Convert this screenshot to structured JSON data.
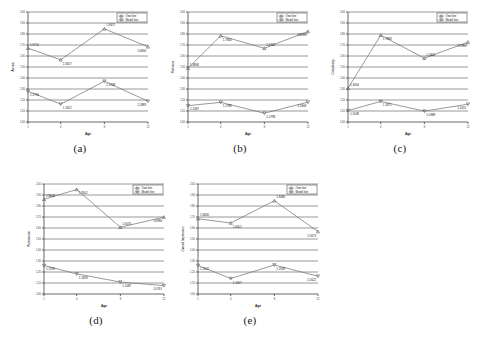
{
  "figure": {
    "panels": [
      {
        "caption": "(a)",
        "xlabel": "Age",
        "ylabel": "Aroma",
        "xticks": [
          "1",
          "4",
          "8",
          "12"
        ],
        "yticks": [
          "1.00",
          "1.10",
          "1.20",
          "1.30",
          "1.40",
          "1.50",
          "1.60",
          "1.70",
          "1.80",
          "1.90",
          "2.00"
        ],
        "legend": [
          "Own line",
          "Model line"
        ],
        "chart_data": {
          "type": "line",
          "title": "",
          "xlabel": "Age",
          "ylabel": "Aroma",
          "x": [
            1,
            4,
            8,
            12
          ],
          "xlim": [
            1,
            12
          ],
          "ylim": [
            1.0,
            2.0
          ],
          "grid": true,
          "legend_position": "top-right",
          "series": [
            {
              "name": "Own line",
              "values": [
                1.671,
                1.5657,
                1.8471,
                1.6836
              ],
              "labels": [
                "1.6710",
                "1.5657",
                "1.8471",
                "1.6836"
              ]
            },
            {
              "name": "Model line",
              "values": [
                1.2794,
                1.1622,
                1.3708,
                1.1889
              ],
              "labels": [
                "1.2794",
                "1.1622",
                "1.3708",
                "1.1889"
              ]
            }
          ]
        }
      },
      {
        "caption": "(b)",
        "xlabel": "Age",
        "ylabel": "Richness",
        "xticks": [
          "1",
          "4",
          "8",
          "12"
        ],
        "yticks": [
          "1.00",
          "1.10",
          "1.20",
          "1.30",
          "1.40",
          "1.50",
          "1.60",
          "1.70",
          "1.80",
          "1.90",
          "2.00"
        ],
        "legend": [
          "Own line",
          "Model line"
        ],
        "chart_data": {
          "type": "line",
          "title": "",
          "xlabel": "Age",
          "ylabel": "Richness",
          "x": [
            1,
            4,
            8,
            12
          ],
          "xlim": [
            1,
            12
          ],
          "ylim": [
            1.0,
            2.0
          ],
          "grid": true,
          "legend_position": "top-right",
          "series": [
            {
              "name": "Own line",
              "values": [
                1.4884,
                1.784,
                1.6702,
                1.8236
              ],
              "labels": [
                "1.4884",
                "1.7840",
                "1.6702",
                "1.8236"
              ]
            },
            {
              "name": "Model line",
              "values": [
                1.1487,
                1.1788,
                1.0798,
                1.1808
              ],
              "labels": [
                "1.1487",
                "1.1788",
                "1.0798",
                "1.1808"
              ]
            }
          ]
        }
      },
      {
        "caption": "(c)",
        "xlabel": "Age",
        "ylabel": "Complexity",
        "xticks": [
          "1",
          "4",
          "8",
          "12"
        ],
        "yticks": [
          "1.00",
          "1.10",
          "1.20",
          "1.30",
          "1.40",
          "1.50",
          "1.60",
          "1.70",
          "1.80",
          "1.90",
          "2.00"
        ],
        "legend": [
          "Own line",
          "Model line"
        ],
        "chart_data": {
          "type": "line",
          "title": "",
          "xlabel": "Age",
          "ylabel": "Complexity",
          "x": [
            1,
            4,
            8,
            12
          ],
          "xlim": [
            1,
            12
          ],
          "ylim": [
            1.0,
            2.0
          ],
          "grid": true,
          "legend_position": "top-right",
          "series": [
            {
              "name": "Own line",
              "values": [
                1.3064,
                1.7888,
                1.5801,
                1.726
              ],
              "labels": [
                "1.3064",
                "1.7888",
                "1.5801",
                "1.7260"
              ]
            },
            {
              "name": "Model line",
              "values": [
                1.1038,
                1.1871,
                1.0988,
                1.162
              ],
              "labels": [
                "1.1038",
                "1.1871",
                "1.0988",
                "1.1620"
              ]
            }
          ]
        }
      },
      {
        "caption": "(d)",
        "xlabel": "Age",
        "ylabel": "Persistence",
        "xticks": [
          "1",
          "4",
          "8",
          "12"
        ],
        "yticks": [
          "1.00",
          "1.10",
          "1.20",
          "1.30",
          "1.40",
          "1.50",
          "1.60",
          "1.70",
          "1.80",
          "1.90",
          "2.00"
        ],
        "legend": [
          "Own line",
          "Model line"
        ],
        "chart_data": {
          "type": "line",
          "title": "",
          "xlabel": "Age",
          "ylabel": "Persistence",
          "x": [
            1,
            4,
            8,
            12
          ],
          "xlim": [
            1,
            12
          ],
          "ylim": [
            1.0,
            2.0
          ],
          "grid": true,
          "legend_position": "top-right",
          "series": [
            {
              "name": "Own line",
              "values": [
                1.8606,
                1.9502,
                1.607,
                1.6986
              ],
              "labels": [
                "1.8606",
                "1.9502",
                "1.6070",
                "1.6986"
              ]
            },
            {
              "name": "Model line",
              "values": [
                1.2596,
                1.1828,
                1.1087,
                1.0761
              ],
              "labels": [
                "1.2596",
                "1.1828",
                "1.1087",
                "1.0761"
              ]
            }
          ]
        }
      },
      {
        "caption": "(e)",
        "xlabel": "Age",
        "ylabel": "Overall Impression",
        "xticks": [
          "1",
          "4",
          "8",
          "12"
        ],
        "yticks": [
          "1.00",
          "1.10",
          "1.20",
          "1.30",
          "1.40",
          "1.50",
          "1.60",
          "1.70",
          "1.80",
          "1.90",
          "2.00"
        ],
        "legend": [
          "Own line",
          "Model line"
        ],
        "chart_data": {
          "type": "line",
          "title": "",
          "xlabel": "Age",
          "ylabel": "Overall Impression",
          "x": [
            1,
            4,
            8,
            12
          ],
          "xlim": [
            1,
            12
          ],
          "ylim": [
            1.0,
            2.0
          ],
          "grid": true,
          "legend_position": "top-right",
          "series": [
            {
              "name": "Own line",
              "values": [
                1.684,
                1.6452,
                1.848,
                1.5673
              ],
              "labels": [
                "1.6840",
                "1.6452",
                "1.8480",
                "1.5673"
              ]
            },
            {
              "name": "Model line",
              "values": [
                1.2602,
                1.1407,
                1.2639,
                1.1622
              ],
              "labels": [
                "1.2602",
                "1.1407",
                "1.2639",
                "1.1622"
              ]
            }
          ]
        }
      }
    ]
  }
}
